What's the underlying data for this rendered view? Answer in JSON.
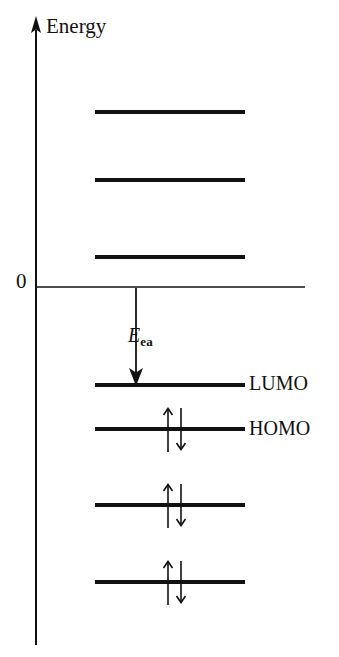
{
  "figure": {
    "kind": "molecular-orbital-energy-level-diagram",
    "background_color": "#ffffff",
    "ink_color": "#111111"
  },
  "axis": {
    "label": "Energy",
    "zero_label": "0",
    "x": 36,
    "top_y": 18,
    "bottom_y": 645,
    "arrow_head": "up-arrow-icon",
    "zero_line_y": 287,
    "zero_line_x1": 36,
    "zero_line_x2": 305
  },
  "annotation": {
    "electron_affinity_symbol": "E",
    "electron_affinity_subscript": "ea",
    "arrow_name": "electron-affinity-arrow",
    "arrow_x": 136,
    "arrow_y_start": 288,
    "arrow_y_end": 385
  },
  "levels": [
    {
      "id": "virtual-3",
      "label": "",
      "y": 112,
      "x1": 95,
      "x2": 245,
      "occupancy": 0,
      "region": "above-zero"
    },
    {
      "id": "virtual-2",
      "label": "",
      "y": 180,
      "x1": 95,
      "x2": 245,
      "occupancy": 0,
      "region": "above-zero"
    },
    {
      "id": "virtual-1",
      "label": "",
      "y": 257,
      "x1": 95,
      "x2": 245,
      "occupancy": 0,
      "region": "above-zero"
    },
    {
      "id": "lumo",
      "label": "LUMO",
      "y": 385,
      "x1": 95,
      "x2": 245,
      "occupancy": 0,
      "region": "below-zero"
    },
    {
      "id": "homo",
      "label": "HOMO",
      "y": 429,
      "x1": 95,
      "x2": 245,
      "occupancy": 2,
      "region": "below-zero"
    },
    {
      "id": "occupied-2",
      "label": "",
      "y": 505,
      "x1": 95,
      "x2": 245,
      "occupancy": 2,
      "region": "below-zero"
    },
    {
      "id": "occupied-3",
      "label": "",
      "y": 582,
      "x1": 95,
      "x2": 245,
      "occupancy": 2,
      "region": "below-zero"
    }
  ],
  "electron_pair": {
    "icon_name": "spin-pair-arrows-icon",
    "center_x": 174,
    "up_arrow_x": 168,
    "down_arrow_x": 181,
    "half_height": 22
  }
}
